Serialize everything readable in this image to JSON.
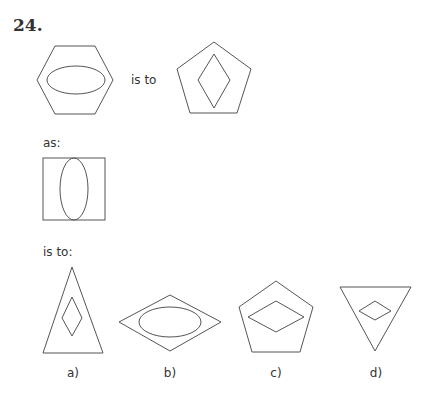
{
  "question": {
    "number": "24.",
    "phrases": {
      "is_to_1": "is to",
      "as": "as:",
      "is_to_2": "is to:"
    }
  },
  "premise": {
    "first": {
      "outer": "hexagon",
      "inner": "horizontal ellipse"
    },
    "second": {
      "outer": "pentagon",
      "inner": "vertical diamond"
    },
    "third": {
      "outer": "square",
      "inner": "vertical ellipse"
    }
  },
  "options": [
    {
      "label": "a)",
      "outer": "tall triangle",
      "inner": "vertical diamond"
    },
    {
      "label": "b)",
      "outer": "horizontal rhombus",
      "inner": "horizontal ellipse"
    },
    {
      "label": "c)",
      "outer": "pentagon",
      "inner": "horizontal diamond"
    },
    {
      "label": "d)",
      "outer": "inverted triangle",
      "inner": "small horizontal diamond"
    }
  ],
  "colors": {
    "stroke": "#555555",
    "text": "#333333",
    "background": "#ffffff"
  }
}
